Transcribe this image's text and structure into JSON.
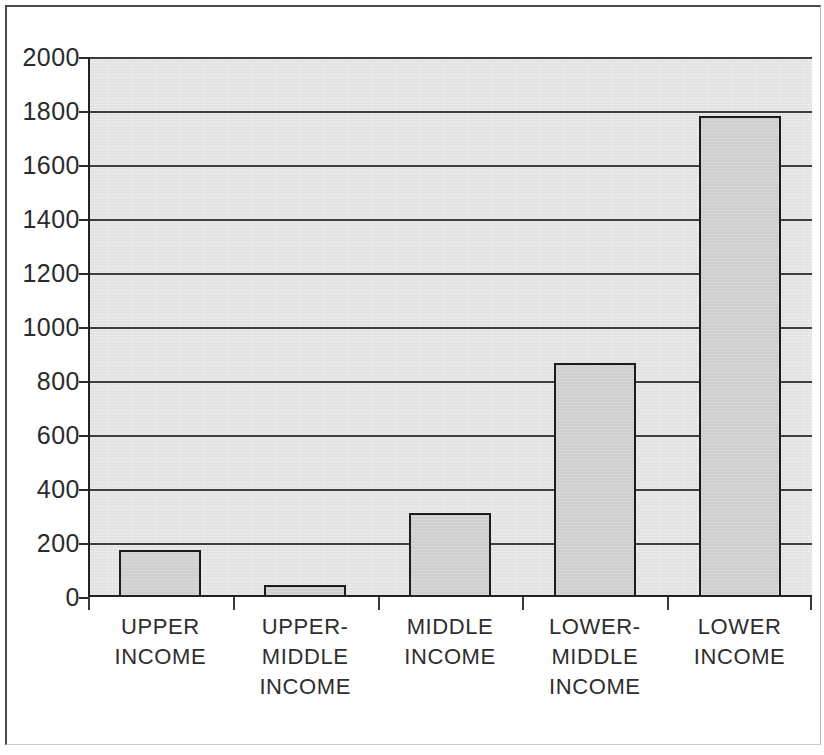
{
  "chart_data": {
    "type": "bar",
    "title": "",
    "subtitle": "",
    "xlabel": "",
    "ylabel": "",
    "ylim": [
      0,
      2000
    ],
    "ytick_step": 200,
    "yticks": [
      2000,
      1800,
      1600,
      1400,
      1200,
      1000,
      800,
      600,
      400,
      200,
      0
    ],
    "ytick_labels": [
      "2000",
      "1800",
      "1600",
      "1400",
      "1200",
      "1000",
      "800",
      "600",
      "400",
      "200",
      "0"
    ],
    "grid": true,
    "grid_axis": "y",
    "legend": false,
    "legend_position": "none",
    "categories": [
      "UPPER INCOME",
      "UPPER-MIDDLE INCOME",
      "MIDDLE INCOME",
      "LOWER-MIDDLE INCOME",
      "LOWER INCOME"
    ],
    "category_label_lines": [
      [
        "UPPER",
        "INCOME"
      ],
      [
        "UPPER-",
        "MIDDLE",
        "INCOME"
      ],
      [
        "MIDDLE",
        "INCOME"
      ],
      [
        "LOWER-",
        "MIDDLE",
        "INCOME"
      ],
      [
        "LOWER",
        "INCOME"
      ]
    ],
    "values": [
      175,
      45,
      310,
      865,
      1780
    ],
    "series": [
      {
        "name": "",
        "values": [
          175,
          45,
          310,
          865,
          1780
        ]
      }
    ],
    "colors": {
      "bar_fill": "#d3d3d3",
      "bar_border": "#1c1c1c",
      "plot_background": "#e9e9e9",
      "gridline": "#3d3d3d",
      "axis": "#222222",
      "text": "#2b2b2b",
      "page_background": "#ffffff",
      "frame_border": "#4a4a4a"
    }
  }
}
